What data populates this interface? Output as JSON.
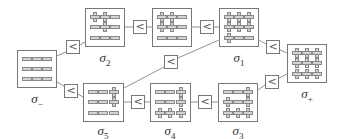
{
  "diagram": {
    "type": "state-ordering-lattice",
    "colors": {
      "stroke": "#777777",
      "symbol_fill": "#d4d4d4",
      "label": "#333333"
    },
    "comparator_symbol": "<",
    "nodes": [
      {
        "id": "sigma_minus",
        "label": "σ",
        "subscript": "−",
        "grid": [
          [
            "-",
            "-",
            "-"
          ],
          [
            "-",
            "-",
            "-"
          ],
          [
            "-",
            "-",
            "-"
          ]
        ]
      },
      {
        "id": "sigma_2",
        "label": "σ",
        "subscript": "2",
        "grid": [
          [
            "+",
            "+",
            "-"
          ],
          [
            "-",
            "+",
            "-"
          ],
          [
            "-",
            "-",
            "-"
          ]
        ]
      },
      {
        "id": "sigma_mid",
        "label": "",
        "subscript": "",
        "grid": [
          [
            "+",
            "+",
            "-"
          ],
          [
            "+",
            "+",
            "-"
          ],
          [
            "-",
            "-",
            "-"
          ]
        ]
      },
      {
        "id": "sigma_1",
        "label": "σ",
        "subscript": "1",
        "grid": [
          [
            "+",
            "+",
            "+"
          ],
          [
            "+",
            "+",
            "+"
          ],
          [
            "+",
            "-",
            "-"
          ]
        ]
      },
      {
        "id": "sigma_plus",
        "label": "σ",
        "subscript": "+",
        "grid": [
          [
            "+",
            "+",
            "+"
          ],
          [
            "+",
            "+",
            "+"
          ],
          [
            "+",
            "+",
            "+"
          ]
        ]
      },
      {
        "id": "sigma_5",
        "label": "σ",
        "subscript": "5",
        "grid": [
          [
            "-",
            "-",
            "+"
          ],
          [
            "-",
            "-",
            "+"
          ],
          [
            "-",
            "-",
            "-"
          ]
        ]
      },
      {
        "id": "sigma_4",
        "label": "σ",
        "subscript": "4",
        "grid": [
          [
            "-",
            "-",
            "+"
          ],
          [
            "-",
            "-",
            "+"
          ],
          [
            "+",
            "+",
            "+"
          ]
        ]
      },
      {
        "id": "sigma_3",
        "label": "σ",
        "subscript": "3",
        "grid": [
          [
            "-",
            "-",
            "+"
          ],
          [
            "+",
            "-",
            "+"
          ],
          [
            "+",
            "+",
            "+"
          ]
        ]
      }
    ],
    "edges": [
      {
        "from": "sigma_minus",
        "to": "sigma_2",
        "relation": "<"
      },
      {
        "from": "sigma_2",
        "to": "sigma_mid",
        "relation": "<"
      },
      {
        "from": "sigma_mid",
        "to": "sigma_1",
        "relation": "<"
      },
      {
        "from": "sigma_1",
        "to": "sigma_plus",
        "relation": "<"
      },
      {
        "from": "sigma_minus",
        "to": "sigma_5",
        "relation": "<"
      },
      {
        "from": "sigma_5",
        "to": "sigma_4",
        "relation": "<"
      },
      {
        "from": "sigma_4",
        "to": "sigma_3",
        "relation": "<"
      },
      {
        "from": "sigma_3",
        "to": "sigma_plus",
        "relation": "<"
      },
      {
        "from": "sigma_5",
        "to": "sigma_1",
        "relation": "<"
      }
    ]
  }
}
